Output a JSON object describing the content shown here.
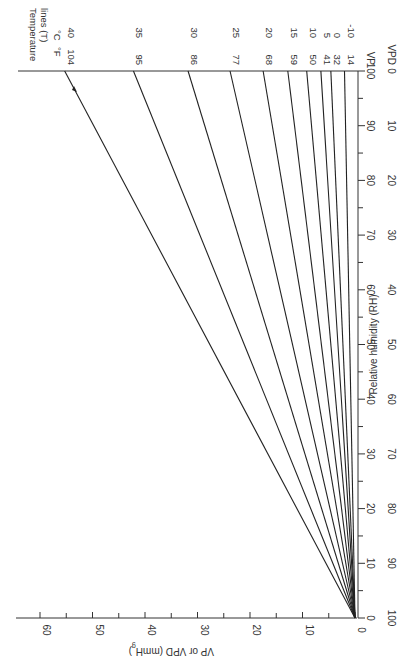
{
  "chart_data": {
    "type": "line",
    "orientation": "rotated 90 degrees clockwise",
    "xlabel": "Relative humidity (RH)",
    "ylabel": "VP or VPD (mmHg)",
    "x_ticks_rh": [
      0,
      10,
      20,
      30,
      40,
      50,
      60,
      70,
      80,
      90,
      100
    ],
    "x_ticks_vpd": [
      100,
      90,
      80,
      70,
      60,
      50,
      40,
      30,
      20,
      10,
      0
    ],
    "x_axis_end_labels": {
      "vp": "VP",
      "vpd": "VPD"
    },
    "y_ticks": [
      0,
      10,
      20,
      30,
      40,
      50,
      60
    ],
    "xlim": [
      0,
      100
    ],
    "ylim": [
      0,
      65
    ],
    "units_header": {
      "c": "°C",
      "f": "°F"
    },
    "series": [
      {
        "name": "40 °C / 104 °F",
        "c": "40",
        "f": "104",
        "x": [
          0,
          100
        ],
        "values": [
          0,
          55.3
        ]
      },
      {
        "name": "35 °C / 95 °F",
        "c": "35",
        "f": "95",
        "x": [
          0,
          100
        ],
        "values": [
          0,
          42.2
        ]
      },
      {
        "name": "30 °C / 86 °F",
        "c": "30",
        "f": "86",
        "x": [
          0,
          100
        ],
        "values": [
          0,
          31.8
        ]
      },
      {
        "name": "25 °C / 77 °F",
        "c": "25",
        "f": "77",
        "x": [
          0,
          100
        ],
        "values": [
          0,
          23.8
        ]
      },
      {
        "name": "20 °C / 68 °F",
        "c": "20",
        "f": "68",
        "x": [
          0,
          100
        ],
        "values": [
          0,
          17.5
        ]
      },
      {
        "name": "15 °C / 59 °F",
        "c": "15",
        "f": "59",
        "x": [
          0,
          100
        ],
        "values": [
          0,
          12.8
        ]
      },
      {
        "name": "10 °C / 50 °F",
        "c": "10",
        "f": "50",
        "x": [
          0,
          100
        ],
        "values": [
          0,
          9.2
        ]
      },
      {
        "name": "5 °C / 41 °F",
        "c": "5",
        "f": "41",
        "x": [
          0,
          100
        ],
        "values": [
          0,
          6.5
        ]
      },
      {
        "name": "0 °C / 32 °F",
        "c": "0",
        "f": "32",
        "x": [
          0,
          100
        ],
        "values": [
          0,
          4.6
        ]
      },
      {
        "name": "-10 °C / 14 °F",
        "c": "-10",
        "f": "14",
        "x": [
          0,
          100
        ],
        "values": [
          0,
          2.0
        ]
      }
    ],
    "grid": false,
    "legend": "none (labels at line ends)"
  },
  "labels": {
    "title_line1": "Temperature",
    "title_line2": "lines (T)",
    "unit_c": "°C",
    "unit_f": "°F",
    "rh_axis": "Relative humidity (RH)",
    "vp_axis": "VP or VPD (mmH",
    "vp_axis_sub": "g",
    "vp_axis_close": ")",
    "vp_end": "VP",
    "vpd_end": "VPD"
  }
}
